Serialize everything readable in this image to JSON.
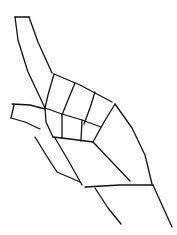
{
  "drawing": {
    "subject": "hand sketch, pointing index finger",
    "width": 177,
    "height": 235,
    "background": "#ffffff",
    "stroke_color": "#111111",
    "stroke_width": 1.3,
    "strokes": [
      {
        "name": "index-finger-top",
        "points": [
          [
            15,
            17
          ],
          [
            29,
            17
          ]
        ]
      },
      {
        "name": "index-finger-left-edge",
        "points": [
          [
            15,
            17
          ],
          [
            18,
            40
          ],
          [
            28,
            72
          ],
          [
            45,
            108
          ]
        ]
      },
      {
        "name": "index-finger-right-edge",
        "points": [
          [
            29,
            17
          ],
          [
            38,
            42
          ],
          [
            52,
            73
          ]
        ]
      },
      {
        "name": "knuckle-top-edge",
        "points": [
          [
            54,
            74
          ],
          [
            80,
            85
          ],
          [
            112,
            102
          ]
        ]
      },
      {
        "name": "knuckle-left-edge",
        "points": [
          [
            54,
            74
          ],
          [
            48,
            95
          ],
          [
            45,
            108
          ]
        ]
      },
      {
        "name": "knuckle-divider-1",
        "points": [
          [
            75,
            83
          ],
          [
            68,
            100
          ],
          [
            62,
            115
          ]
        ]
      },
      {
        "name": "knuckle-divider-2",
        "points": [
          [
            95,
            92
          ],
          [
            90,
            108
          ],
          [
            84,
            124
          ]
        ]
      },
      {
        "name": "knuckle-middle-line",
        "points": [
          [
            45,
            108
          ],
          [
            62,
            114
          ],
          [
            82,
            120
          ],
          [
            101,
            127
          ]
        ]
      },
      {
        "name": "knuckle-lower-left",
        "points": [
          [
            45,
            108
          ],
          [
            46,
            122
          ],
          [
            53,
            137
          ]
        ]
      },
      {
        "name": "knuckle-divider-3",
        "points": [
          [
            62,
            114
          ],
          [
            62,
            138
          ]
        ]
      },
      {
        "name": "knuckle-divider-4",
        "points": [
          [
            82,
            120
          ],
          [
            81,
            141
          ]
        ]
      },
      {
        "name": "knuckle-bottom-line",
        "points": [
          [
            53,
            137
          ],
          [
            70,
            139
          ],
          [
            93,
            142
          ]
        ]
      },
      {
        "name": "thumb-top",
        "points": [
          [
            12,
            104
          ],
          [
            30,
            105
          ],
          [
            45,
            109
          ]
        ]
      },
      {
        "name": "thumb-left",
        "points": [
          [
            14,
            105
          ],
          [
            11,
            118
          ]
        ]
      },
      {
        "name": "thumb-bottom",
        "points": [
          [
            11,
            118
          ],
          [
            25,
            122
          ],
          [
            40,
            129
          ]
        ]
      },
      {
        "name": "hand-right-inner",
        "points": [
          [
            115,
            104
          ],
          [
            104,
            122
          ],
          [
            93,
            142
          ]
        ]
      },
      {
        "name": "hand-right-outer",
        "points": [
          [
            115,
            104
          ],
          [
            132,
            128
          ],
          [
            145,
            155
          ],
          [
            152,
            184
          ]
        ]
      },
      {
        "name": "palm-crease",
        "points": [
          [
            93,
            142
          ],
          [
            112,
            162
          ],
          [
            130,
            181
          ]
        ]
      },
      {
        "name": "finger-curl-1",
        "points": [
          [
            35,
            137
          ],
          [
            46,
            155
          ],
          [
            57,
            172
          ],
          [
            80,
            182
          ]
        ]
      },
      {
        "name": "finger-curl-2",
        "points": [
          [
            55,
            138
          ],
          [
            68,
            160
          ],
          [
            82,
            185
          ]
        ]
      },
      {
        "name": "wrist-top",
        "points": [
          [
            85,
            187
          ],
          [
            120,
            185
          ],
          [
            153,
            185
          ]
        ]
      },
      {
        "name": "wrist-right",
        "points": [
          [
            153,
            185
          ],
          [
            162,
            205
          ],
          [
            172,
            227
          ]
        ]
      },
      {
        "name": "wrist-left",
        "points": [
          [
            95,
            188
          ],
          [
            108,
            208
          ],
          [
            121,
            224
          ]
        ]
      }
    ]
  }
}
